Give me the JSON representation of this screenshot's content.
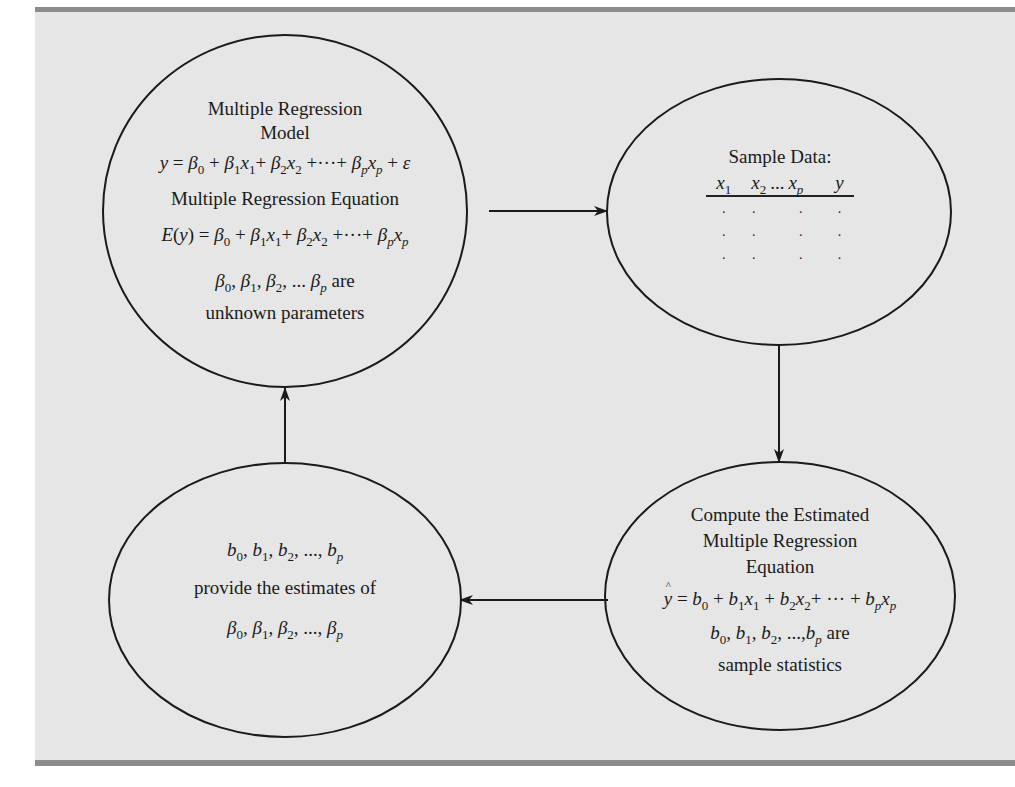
{
  "colors": {
    "panel_background": "#e6e6e6",
    "frame_bar": "#8c8c8c",
    "stroke": "#1a1a1a",
    "text": "#1a1a1a"
  },
  "nodes": {
    "model": {
      "title_line1": "Multiple Regression",
      "title_line2": "Model",
      "model_equation": "y = β0 + β1x1 + β2x2 + ··· + βpxp + ε",
      "equation_title": "Multiple Regression Equation",
      "regression_equation": "E(y) = β0 + β1x1 + β2x2 + ··· + βpxp",
      "params_line": "β0, β1, β2, ... βp are",
      "params_caption": "unknown parameters"
    },
    "sample_data": {
      "title": "Sample Data:",
      "columns": [
        "x1",
        "x2",
        "...",
        "xp",
        "y"
      ],
      "rows": [
        [
          ".",
          ".",
          "",
          ".",
          "."
        ],
        [
          ".",
          ".",
          "",
          ".",
          "."
        ],
        [
          ".",
          ".",
          "",
          ".",
          "."
        ]
      ]
    },
    "compute": {
      "title_line1": "Compute the Estimated",
      "title_line2": "Multiple Regression",
      "title_line3": "Equation",
      "estimated_equation": "ŷ = b0 + b1x1 + b2x2 + ··· + bpxp",
      "stats_line": "b0, b1, b2, ..., bp are",
      "stats_caption": "sample statistics"
    },
    "estimates": {
      "estimators_line": "b0, b1, b2, ..., bp",
      "caption": "provide the estimates of",
      "parameters_line": "β0, β1, β2, ..., βp"
    }
  },
  "edges": [
    {
      "from": "model",
      "to": "sample_data",
      "direction": "right"
    },
    {
      "from": "sample_data",
      "to": "compute",
      "direction": "down"
    },
    {
      "from": "compute",
      "to": "estimates",
      "direction": "left"
    },
    {
      "from": "estimates",
      "to": "model",
      "direction": "up"
    }
  ],
  "symbols": {
    "beta": "β",
    "eps": "ε",
    "eq": "=",
    "plus": "+",
    "cdots": "···",
    "ldots": "...",
    "comma": ",",
    "y": "y",
    "x": "x",
    "b": "b",
    "E": "E",
    "s0": "0",
    "s1": "1",
    "s2": "2",
    "sp": "p"
  }
}
